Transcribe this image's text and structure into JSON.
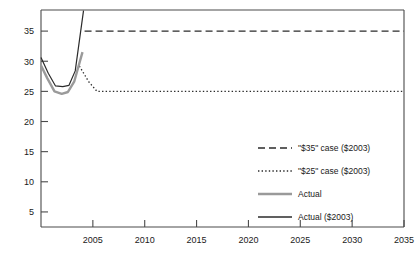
{
  "chart_data": {
    "type": "line",
    "title": "",
    "subtitle": "",
    "xlabel": "",
    "ylabel": "",
    "xlim": [
      2000,
      2035
    ],
    "ylim": [
      2.5,
      38.5
    ],
    "yticks": [
      5,
      10,
      15,
      20,
      25,
      30,
      35
    ],
    "xticks": [
      2005,
      2010,
      2015,
      2020,
      2025,
      2030,
      2035
    ],
    "ytick_labels": [
      "5",
      "10",
      "15",
      "20",
      "25",
      "30",
      "35"
    ],
    "xtick_labels": [
      "2005",
      "2010",
      "2015",
      "2020",
      "2025",
      "2030",
      "2035"
    ],
    "grid": false,
    "legend_position": "center-right",
    "series": [
      {
        "name": "\"$35\" case ($2003)",
        "style": "dashed",
        "color": "#2b2b2b",
        "width": 1.3,
        "x": [
          2004.2,
          2035
        ],
        "values": [
          35,
          35
        ]
      },
      {
        "name": "\"$25\" case ($2003)",
        "style": "dotted",
        "color": "#2b2b2b",
        "width": 1.3,
        "x": [
          2003.7,
          2004.6,
          2005.4,
          2035
        ],
        "values": [
          29.2,
          26.6,
          25.0,
          25.0
        ]
      },
      {
        "name": "Actual",
        "style": "solid",
        "color": "#9a9a9a",
        "width": 2.4,
        "x": [
          2000.0,
          2000.6,
          2001.3,
          2002.0,
          2002.6,
          2003.2,
          2004.0
        ],
        "values": [
          29.3,
          27.2,
          25.0,
          24.6,
          24.9,
          26.6,
          31.5
        ]
      },
      {
        "name": "Actual ($2003)",
        "style": "solid",
        "color": "#2b2b2b",
        "width": 1.2,
        "x": [
          2000.0,
          2000.7,
          2001.4,
          2002.1,
          2002.7,
          2003.3,
          2004.1
        ],
        "values": [
          30.6,
          28.0,
          25.9,
          25.8,
          26.0,
          28.4,
          38.4
        ]
      }
    ],
    "legend_entries": [
      {
        "label": "\"$35\" case ($2003)",
        "style": "dashed",
        "color": "#2b2b2b"
      },
      {
        "label": "\"$25\" case ($2003)",
        "style": "dotted",
        "color": "#2b2b2b"
      },
      {
        "label": "Actual",
        "style": "solid-thick",
        "color": "#9a9a9a"
      },
      {
        "label": "Actual ($2003)",
        "style": "solid",
        "color": "#2b2b2b"
      }
    ]
  },
  "axes": {
    "axis_color": "#4a4a4a"
  }
}
